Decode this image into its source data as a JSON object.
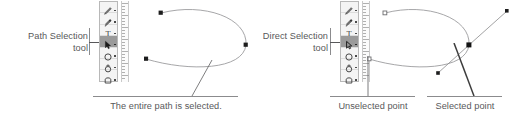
{
  "figure": {
    "background_color": "#ffffff",
    "ink_color": "#58585a",
    "rule_color": "#8b8b8d",
    "panels": [
      {
        "id": "path-selection",
        "callout_label": "Path Selection\ntool",
        "caption": "The entire path is selected.",
        "palette": {
          "selected_index": 3,
          "tools": [
            {
              "name": "pen-tool-icon",
              "selected": false
            },
            {
              "name": "pen-freeform-tool-icon",
              "selected": false
            },
            {
              "name": "type-tool-icon",
              "selected": false
            },
            {
              "name": "path-selection-tool-icon",
              "selected": true
            },
            {
              "name": "ellipse-shape-tool-icon",
              "selected": false
            },
            {
              "name": "custom-shape-tool-icon",
              "selected": false
            },
            {
              "name": "rounded-rectangle-tool-icon",
              "selected": false
            }
          ]
        },
        "path": {
          "description": "open D-shaped bezier path, entire path selected",
          "anchor_points": [
            {
              "x": 17,
              "y": 9,
              "state": "selected"
            },
            {
              "x": 102,
              "y": 41,
              "state": "selected"
            },
            {
              "x": 2,
              "y": 55,
              "state": "selected"
            }
          ],
          "anchor_style": "solid-square",
          "direction_handles": []
        }
      },
      {
        "id": "direct-selection",
        "callout_label": "Direct Selection\ntool",
        "caption_left": "Unselected point",
        "caption_right": "Selected point",
        "palette": {
          "selected_index": 3,
          "tools": [
            {
              "name": "pen-tool-icon",
              "selected": false
            },
            {
              "name": "pen-freeform-tool-icon",
              "selected": false
            },
            {
              "name": "type-tool-icon",
              "selected": false
            },
            {
              "name": "direct-selection-tool-icon",
              "selected": true
            },
            {
              "name": "ellipse-shape-tool-icon",
              "selected": false
            },
            {
              "name": "custom-shape-tool-icon",
              "selected": false
            },
            {
              "name": "rounded-rectangle-tool-icon",
              "selected": false
            }
          ]
        },
        "path": {
          "description": "open D-shaped bezier path, one anchor point selected with direction handles",
          "anchor_points": [
            {
              "x": 18,
              "y": 9,
              "state": "unselected"
            },
            {
              "x": 102,
              "y": 41,
              "state": "selected"
            },
            {
              "x": 2,
              "y": 55,
              "state": "unselected"
            }
          ],
          "anchor_style_selected": "solid-square",
          "anchor_style_unselected": "hollow-square",
          "direction_handles": [
            {
              "from_x": 102,
              "from_y": 41,
              "to_x": 140,
              "to_y": 7,
              "endpoint": "solid-square"
            },
            {
              "from_x": 102,
              "from_y": 41,
              "to_x": 71,
              "to_y": 69,
              "endpoint": "solid-square"
            }
          ]
        }
      }
    ]
  }
}
